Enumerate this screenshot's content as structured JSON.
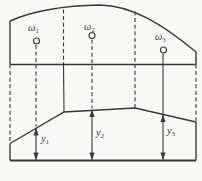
{
  "figure": {
    "labels": {
      "omega": [
        {
          "base": "ω",
          "sub": "1"
        },
        {
          "base": "ω",
          "sub": "2"
        },
        {
          "base": "ω",
          "sub": "3"
        }
      ],
      "y": [
        {
          "base": "y",
          "sub": "1"
        },
        {
          "base": "y",
          "sub": "2"
        },
        {
          "base": "y",
          "sub": "3"
        }
      ]
    },
    "colors": {
      "line": "#383838",
      "background": "#f9f9f7"
    }
  }
}
